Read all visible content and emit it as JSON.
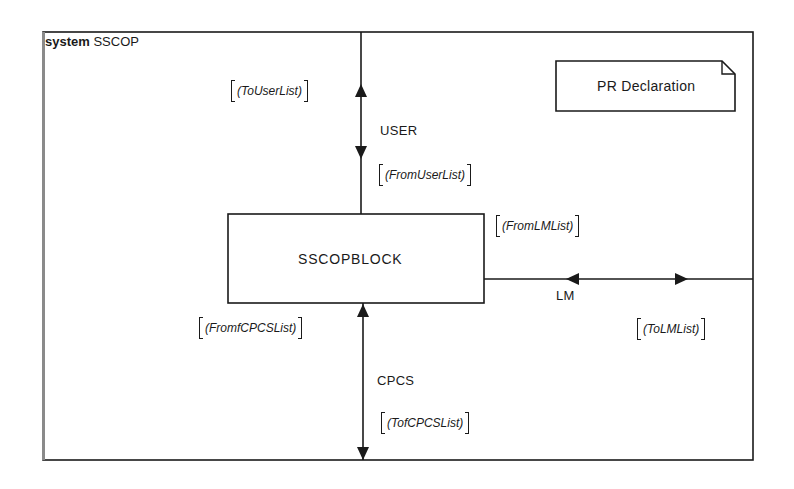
{
  "system": {
    "keyword": "system",
    "name": "SSCOP"
  },
  "text_symbol": {
    "label": "PR Declaration"
  },
  "block": {
    "name": "SSCOPBLOCK"
  },
  "channels": [
    {
      "name": "USER",
      "signal_lists": {
        "out": "(ToUserList)",
        "in": "(FromUserList)"
      }
    },
    {
      "name": "LM",
      "signal_lists": {
        "in": "(FromLMList)",
        "out": "(ToLMList)"
      }
    },
    {
      "name": "CPCS",
      "signal_lists": {
        "in": "(FromfCPCSList)",
        "out": "(TofCPCSList)"
      }
    }
  ],
  "colors": {
    "line": "#1a1a1a",
    "background": "#ffffff"
  }
}
